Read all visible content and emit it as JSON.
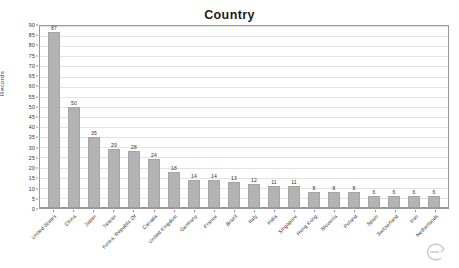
{
  "chart_data": {
    "type": "bar",
    "title": "Country",
    "xlabel": "",
    "ylabel": "Records",
    "ylim": [
      0,
      90
    ],
    "ytick_step": 5,
    "yticks": [
      90,
      85,
      80,
      75,
      70,
      65,
      60,
      55,
      50,
      45,
      40,
      35,
      30,
      25,
      20,
      15,
      10,
      5,
      0
    ],
    "grid": true,
    "legend": "none",
    "bar_color": "#b3b3b3",
    "categories": [
      "United States",
      "China",
      "Japan",
      "Taiwan",
      "Korea, Republic Of",
      "Canada",
      "United Kingdom",
      "Germany",
      "France",
      "Brazil",
      "Italy",
      "India",
      "Singapore",
      "Hong Kong",
      "Slovenia",
      "Poland",
      "Spain",
      "Switzerland",
      "Iran",
      "Netherlands"
    ],
    "values": [
      87,
      50,
      35,
      29,
      28,
      24,
      18,
      14,
      14,
      13,
      12,
      11,
      11,
      8,
      8,
      8,
      6,
      6,
      6,
      6
    ]
  },
  "artifacts": {
    "speck_a": "",
    "speck_b": "",
    "speck_c": ""
  }
}
